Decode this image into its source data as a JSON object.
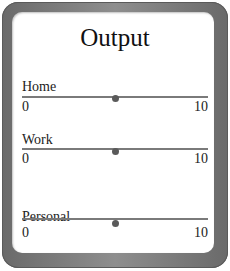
{
  "panel": {
    "title": "Output"
  },
  "sliders": [
    {
      "label": "Home",
      "min": "0",
      "max": "10",
      "value": 5
    },
    {
      "label": "Work",
      "min": "0",
      "max": "10",
      "value": 5
    },
    {
      "label": "Personal",
      "min": "0",
      "max": "10",
      "value": 5
    }
  ],
  "colors": {
    "frame": "#7a7a7a",
    "track": "#7a7a7a",
    "thumb": "#5a5a5a",
    "background": "#ffffff"
  }
}
